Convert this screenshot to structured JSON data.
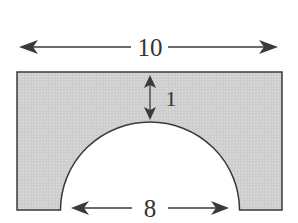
{
  "figure": {
    "type": "dimensioned-shape",
    "fill_color": "#d4d4d4",
    "stroke_color": "#3a3a3a",
    "dimensions": {
      "width": {
        "value": 10,
        "label": "10"
      },
      "arch_diameter": {
        "value": 8,
        "label": "8"
      },
      "top_thickness": {
        "value": 1,
        "label": "1"
      }
    }
  }
}
